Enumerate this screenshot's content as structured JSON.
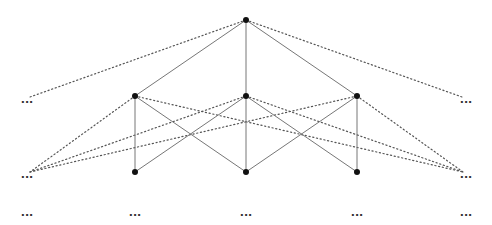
{
  "diagram": {
    "type": "lattice-graph",
    "colors": {
      "background": "#ffffff",
      "node": "#111111",
      "solid_edge": "#777777",
      "dotted_edge": "#555555",
      "ellipsis": "#333333"
    },
    "nodes": [
      {
        "id": "top",
        "x": 246,
        "y": 20
      },
      {
        "id": "m1",
        "x": 135,
        "y": 96
      },
      {
        "id": "m2",
        "x": 246,
        "y": 96
      },
      {
        "id": "m3",
        "x": 357,
        "y": 96
      },
      {
        "id": "b1",
        "x": 135,
        "y": 172
      },
      {
        "id": "b2",
        "x": 246,
        "y": 172
      },
      {
        "id": "b3",
        "x": 357,
        "y": 172
      }
    ],
    "solid_edges": [
      [
        "top",
        "m1"
      ],
      [
        "top",
        "m2"
      ],
      [
        "top",
        "m3"
      ],
      [
        "m1",
        "b1"
      ],
      [
        "m1",
        "b2"
      ],
      [
        "m2",
        "b1"
      ],
      [
        "m2",
        "b2"
      ],
      [
        "m2",
        "b3"
      ],
      [
        "m3",
        "b2"
      ],
      [
        "m3",
        "b3"
      ]
    ],
    "ellipses": [
      {
        "id": "e-left-mid",
        "x": 27,
        "y": 100,
        "text": "..."
      },
      {
        "id": "e-right-mid",
        "x": 466,
        "y": 100,
        "text": "..."
      },
      {
        "id": "e-left-low",
        "x": 27,
        "y": 175,
        "text": "..."
      },
      {
        "id": "e-right-low",
        "x": 466,
        "y": 175,
        "text": "..."
      },
      {
        "id": "e-bottom-1",
        "x": 27,
        "y": 213,
        "text": "..."
      },
      {
        "id": "e-bottom-2",
        "x": 135,
        "y": 213,
        "text": "..."
      },
      {
        "id": "e-bottom-3",
        "x": 246,
        "y": 213,
        "text": "..."
      },
      {
        "id": "e-bottom-4",
        "x": 357,
        "y": 213,
        "text": "..."
      },
      {
        "id": "e-bottom-5",
        "x": 466,
        "y": 213,
        "text": "..."
      }
    ],
    "dotted_edges": [
      {
        "from": [
          246,
          20
        ],
        "to": [
          30,
          97
        ]
      },
      {
        "from": [
          246,
          20
        ],
        "to": [
          462,
          97
        ]
      },
      {
        "from": [
          135,
          96
        ],
        "to": [
          30,
          172
        ]
      },
      {
        "from": [
          246,
          96
        ],
        "to": [
          30,
          172
        ]
      },
      {
        "from": [
          357,
          96
        ],
        "to": [
          30,
          172
        ]
      },
      {
        "from": [
          135,
          96
        ],
        "to": [
          463,
          172
        ]
      },
      {
        "from": [
          246,
          96
        ],
        "to": [
          463,
          172
        ]
      },
      {
        "from": [
          357,
          96
        ],
        "to": [
          463,
          172
        ]
      }
    ]
  }
}
